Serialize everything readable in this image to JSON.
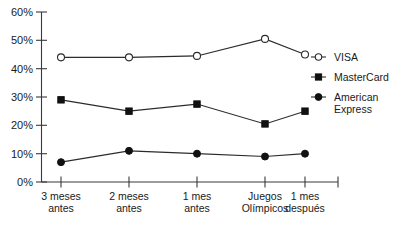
{
  "chart_data": {
    "type": "line",
    "title": "",
    "subtitle": "",
    "xlabel": "",
    "ylabel": "",
    "categories": [
      "3 meses antes",
      "2 meses antes",
      "1 mes antes",
      "Juegos Olímpicos",
      "1 mes después"
    ],
    "category_lines": [
      [
        "3 meses",
        "antes"
      ],
      [
        "2 meses",
        "antes"
      ],
      [
        "1 mes",
        "antes"
      ],
      [
        "Juegos",
        "Olímpicos"
      ],
      [
        "1 mes",
        "después"
      ]
    ],
    "series": [
      {
        "name": "VISA",
        "marker": "open-circle",
        "values": [
          44,
          44,
          44.5,
          50.5,
          45
        ]
      },
      {
        "name": "MasterCard",
        "marker": "filled-square",
        "values": [
          29,
          25,
          27.5,
          20.5,
          25
        ]
      },
      {
        "name": "American Express",
        "marker": "filled-circle",
        "values": [
          7,
          11,
          10,
          9,
          10
        ]
      }
    ],
    "ylim": [
      0,
      60
    ],
    "yticks": [
      0,
      10,
      20,
      30,
      40,
      50,
      60
    ],
    "ytick_labels": [
      "0%",
      "10%",
      "20%",
      "30%",
      "40%",
      "50%",
      "60%"
    ],
    "grid": false,
    "legend_position": "right",
    "colors": {
      "axis": "#3a3a3a",
      "line": "#2b2b2b",
      "marker_fill": "#111111",
      "marker_open_fill": "#ffffff",
      "text": "#1a1a1a",
      "background": "#ffffff"
    }
  },
  "legend": {
    "entries": [
      {
        "label": "VISA",
        "marker": "open-circle"
      },
      {
        "label": "MasterCard",
        "marker": "filled-square"
      },
      {
        "label": "American Express",
        "marker": "filled-circle",
        "label_lines": [
          "American",
          "Express"
        ]
      }
    ]
  }
}
